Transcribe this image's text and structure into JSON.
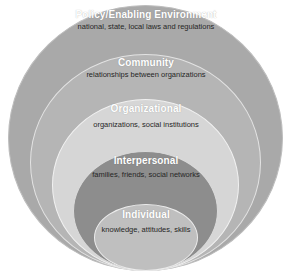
{
  "diagram": {
    "name": "socio-ecological-model",
    "shape": "nested-circles",
    "canvas": {
      "width": 292,
      "height": 278,
      "background": "#ffffff"
    },
    "levels": [
      {
        "id": "policy",
        "title": "Policy/Enabling Environment",
        "description": "national, state, local laws and regulations",
        "fill": "#a9a9a9",
        "outline": "#bdbdbd",
        "title_color": "#ffffff",
        "description_color": "#262626",
        "order": 1
      },
      {
        "id": "community",
        "title": "Community",
        "description": "relationships between organizations",
        "fill": "#b5b5b5",
        "outline": "#e3e3e3",
        "title_color": "#ffffff",
        "description_color": "#262626",
        "order": 2
      },
      {
        "id": "organizational",
        "title": "Organizational",
        "description": "organizations, social institutions",
        "fill": "#d6d6d6",
        "outline": "#f1f1f1",
        "title_color": "#ffffff",
        "description_color": "#262626",
        "order": 3
      },
      {
        "id": "interpersonal",
        "title": "Interpersonal",
        "description": "families, friends, social networks",
        "fill": "#8d8d8d",
        "outline": "#dadada",
        "title_color": "#ffffff",
        "description_color": "#262626",
        "order": 4
      },
      {
        "id": "individual",
        "title": "Individual",
        "description": "knowledge, attitudes, skills",
        "fill": "#bfbfbf",
        "outline": "#ececec",
        "title_color": "#ffffff",
        "description_color": "#262626",
        "order": 5
      }
    ]
  }
}
